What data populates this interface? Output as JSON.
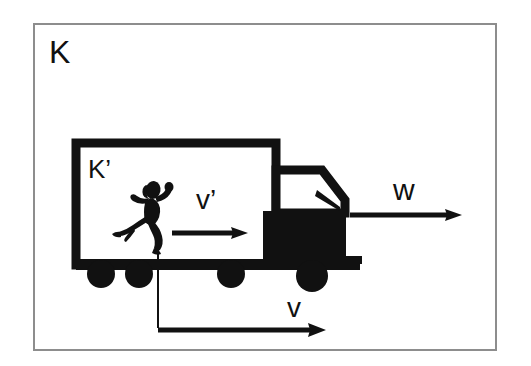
{
  "figure": {
    "type": "physics-schematic",
    "background_color": "#ffffff",
    "ink_color": "#111111",
    "frame": {
      "name": "outer-reference-frame",
      "label": "K",
      "border_color": "#8a8a8a",
      "border_width_px": 2,
      "x": 33,
      "y": 23,
      "width": 464,
      "height": 328
    },
    "inner_frame": {
      "name": "truck-box-reference-frame",
      "label": "K'",
      "border_color": "#111111",
      "border_width_px": 8
    },
    "labels": {
      "outer_frame": "K",
      "inner_frame": "K’",
      "runner_velocity": "v’",
      "truck_velocity": "v",
      "total_velocity": "w"
    },
    "vectors": [
      {
        "name": "runner-velocity-arrow",
        "label": "v’",
        "description": "velocity of the runner relative to the truck (frame K’)",
        "location": "inside truck box",
        "direction": "right"
      },
      {
        "name": "truck-velocity-arrow",
        "label": "v",
        "description": "velocity of the truck relative to the ground (frame K)",
        "location": "below truck",
        "direction": "right"
      },
      {
        "name": "total-velocity-arrow",
        "label": "w",
        "description": "velocity of the runner relative to the ground, w = v + v’",
        "location": "right of truck cab",
        "direction": "right"
      }
    ],
    "truck": {
      "name": "truck",
      "parts": [
        "cargo-box",
        "cab",
        "windshield",
        "bumper",
        "wheel-1",
        "wheel-2",
        "wheel-3",
        "wheel-4"
      ],
      "wheel_count": 4,
      "facing": "right"
    },
    "runner": {
      "name": "running-person",
      "facing": "right",
      "inside": "cargo-box"
    }
  }
}
